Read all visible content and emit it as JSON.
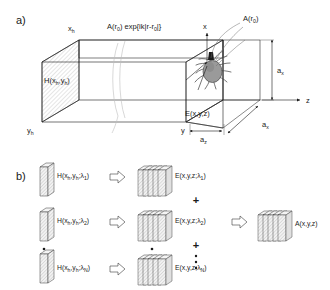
{
  "figure": {
    "panels": [
      {
        "letter": "a)",
        "name": "volume-propagation-panel",
        "labels": {
          "hologram_plane": "H(xh,yh)",
          "hologram_plane_h": "H",
          "propagation_term": "A(r0) exp{ik|r-r0|}",
          "amplitude_point": "A(r0)",
          "field_label": "E(x,y,z)",
          "axis_x": "x",
          "axis_y": "y",
          "axis_z": "z",
          "axis_xh": "xh",
          "axis_yh": "yh",
          "dim_height": "ax",
          "dim_depth": "ax",
          "dim_length": "az"
        },
        "object": "tick-specimen"
      },
      {
        "letter": "b)",
        "name": "multiwavelength-synthesis-panel",
        "arrow_glyph": "rightwards-double-arrow",
        "sum_glyph": "+",
        "vertical_ellipsis": "vertical-dots",
        "rows": [
          {
            "hologram": "H(xh,yh;λ1)",
            "volume": "E(x,y,z;λ1)"
          },
          {
            "hologram": "H(xh,yh;λ2)",
            "volume": "E(x,y,z;λ2)"
          },
          {
            "hologram": "H(xh,yh;λN)",
            "volume": "E(x,y,z;λN)"
          }
        ],
        "result": "A(x,y,z)"
      }
    ],
    "colors": {
      "ink": "#1a1a1a",
      "slab_fill": "#e8e8e8",
      "wave_gray": "#bdbdbd",
      "object_gray": "#9a9a9a",
      "background": "#ffffff"
    }
  }
}
